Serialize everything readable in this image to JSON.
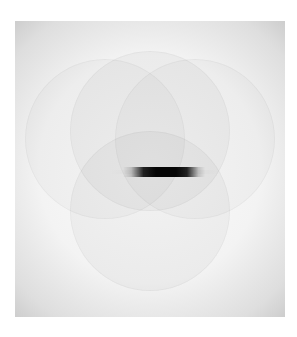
{
  "image": {
    "description": "Grayscale pattern with vignetted square, four overlapping faint circles, and a dark horizontal bar at center",
    "colors": {
      "background": "#ffffff",
      "frame_center": "#fbfbfb",
      "frame_edge": "#bdbdbd",
      "bar": "#050505"
    }
  }
}
